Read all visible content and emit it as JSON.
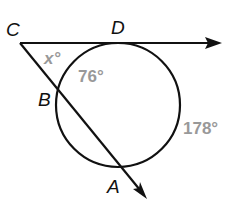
{
  "diagram": {
    "points": {
      "C": "C",
      "D": "D",
      "B": "B",
      "A": "A"
    },
    "angles": {
      "x": "x°",
      "arc_DB": "76°",
      "arc_DA": "178°"
    },
    "colors": {
      "line": "#111111",
      "label_gray": "#999999"
    }
  }
}
